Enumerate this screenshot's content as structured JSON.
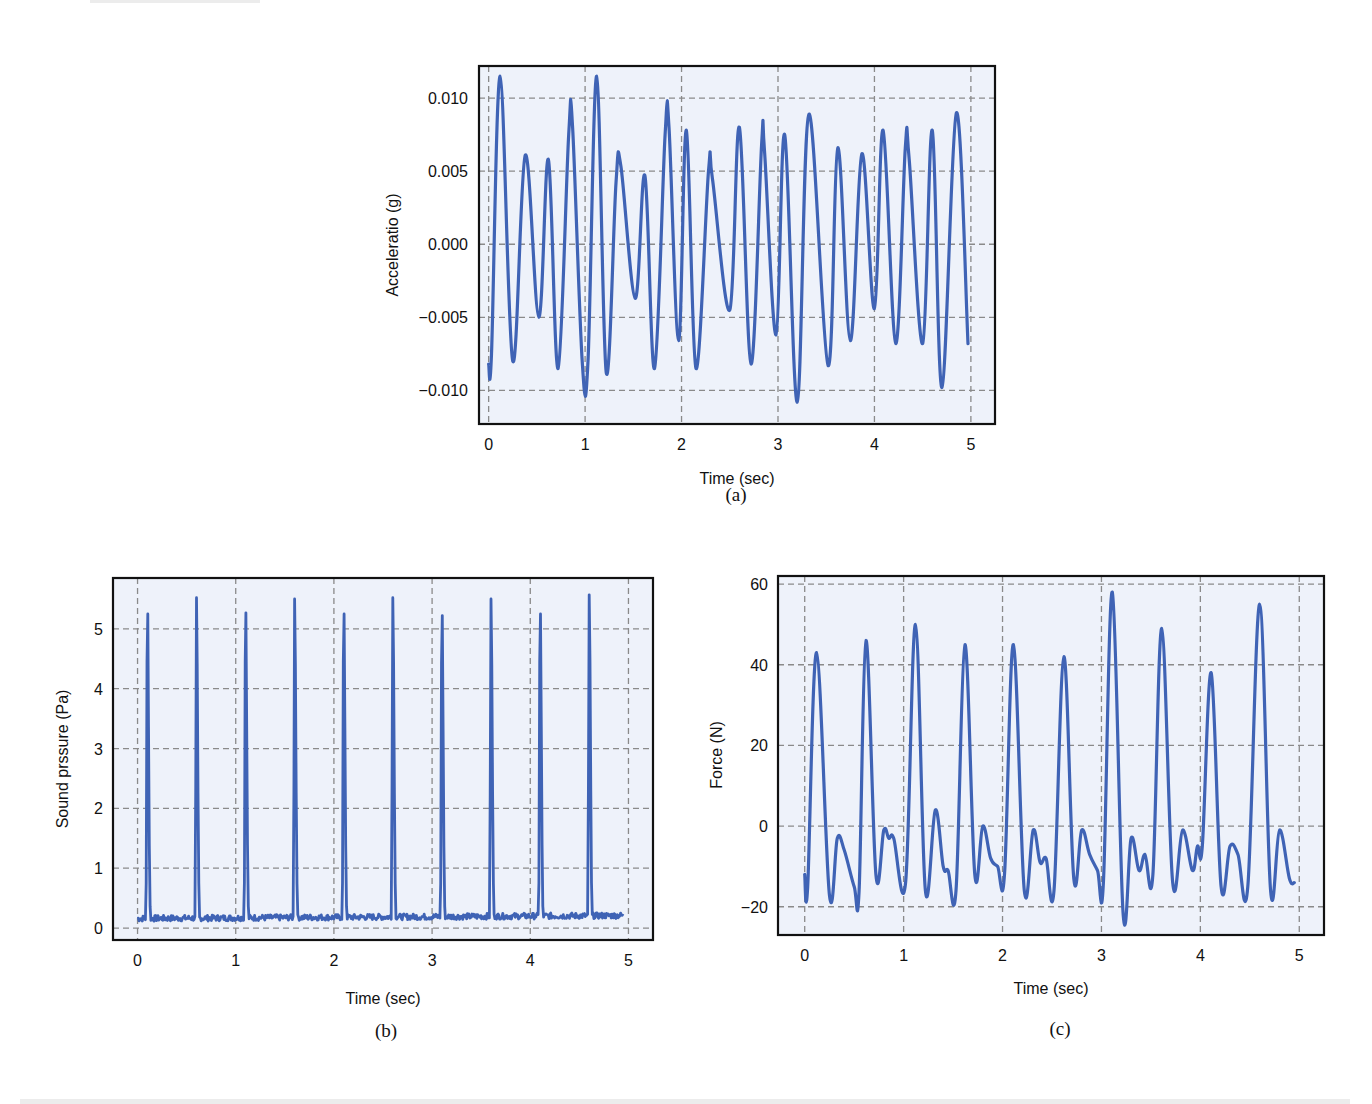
{
  "colors": {
    "plot_bg": "#eef2fa",
    "line": "#3f63b5",
    "grid": "#8a8a8a",
    "frame": "#111111"
  },
  "chart_data": [
    {
      "id": "a",
      "type": "line",
      "caption": "(a)",
      "title": "",
      "xlabel": "Time (sec)",
      "ylabel": "Acceleratio (g)",
      "xlim": [
        -0.1,
        5.25
      ],
      "ylim": [
        -0.0123,
        0.0122
      ],
      "xticks": [
        0,
        1,
        2,
        3,
        4,
        5
      ],
      "xtick_labels": [
        "0",
        "1",
        "2",
        "3",
        "4",
        "5"
      ],
      "yticks": [
        -0.01,
        -0.005,
        0.0,
        0.005,
        0.01
      ],
      "ytick_labels": [
        "−0.010",
        "−0.005",
        "0.000",
        "0.005",
        "0.010"
      ],
      "grid": true,
      "legend": null,
      "series": [
        {
          "name": "Acceleration",
          "x": [
            0.0,
            0.03,
            0.12,
            0.25,
            0.38,
            0.52,
            0.62,
            0.72,
            0.83,
            0.87,
            0.97,
            1.03,
            1.12,
            1.22,
            1.32,
            1.37,
            1.52,
            1.62,
            1.72,
            1.83,
            1.87,
            1.97,
            2.05,
            2.15,
            2.28,
            2.32,
            2.5,
            2.6,
            2.72,
            2.83,
            2.86,
            2.98,
            3.07,
            3.2,
            3.32,
            3.52,
            3.62,
            3.75,
            3.87,
            4.0,
            4.09,
            4.22,
            4.32,
            4.36,
            4.5,
            4.6,
            4.7,
            4.85,
            4.97
          ],
          "y": [
            -0.0082,
            -0.0075,
            0.0115,
            -0.008,
            0.0061,
            -0.005,
            0.0058,
            -0.0085,
            0.0075,
            0.008,
            -0.008,
            -0.008,
            0.0115,
            -0.0088,
            0.0042,
            0.0054,
            -0.0037,
            0.0047,
            -0.0085,
            0.0075,
            0.008,
            -0.0066,
            0.0078,
            -0.0085,
            0.005,
            0.0045,
            -0.0045,
            0.008,
            -0.0082,
            0.0068,
            0.0064,
            -0.0062,
            0.0075,
            -0.0108,
            0.0089,
            -0.0083,
            0.0066,
            -0.0066,
            0.0062,
            -0.0044,
            0.0078,
            -0.0068,
            0.0066,
            0.0058,
            -0.0068,
            0.0078,
            -0.0098,
            0.009,
            -0.0068
          ]
        }
      ]
    },
    {
      "id": "b",
      "type": "line",
      "caption": "(b)",
      "title": "",
      "xlabel": "Time (sec)",
      "ylabel": "Sound prssure (Pa)",
      "xlim": [
        -0.25,
        5.25
      ],
      "ylim": [
        -0.2,
        5.85
      ],
      "xticks": [
        0,
        1,
        2,
        3,
        4,
        5
      ],
      "xtick_labels": [
        "0",
        "1",
        "2",
        "3",
        "4",
        "5"
      ],
      "yticks": [
        0,
        1,
        2,
        3,
        4,
        5
      ],
      "ytick_labels": [
        "0",
        "1",
        "2",
        "3",
        "4",
        "5"
      ],
      "grid": true,
      "legend": null,
      "series": [
        {
          "name": "Sound pressure",
          "peak_times": [
            0.1,
            0.6,
            1.1,
            1.6,
            2.1,
            2.6,
            3.1,
            3.6,
            4.1,
            4.6
          ],
          "peak_values": [
            5.55,
            5.52,
            5.57,
            5.5,
            5.55,
            5.52,
            5.52,
            5.5,
            5.55,
            5.57
          ],
          "baseline_range": [
            0.05,
            0.25
          ],
          "x_range": [
            0.0,
            4.95
          ]
        }
      ]
    },
    {
      "id": "c",
      "type": "line",
      "caption": "(c)",
      "title": "",
      "xlabel": "Time (sec)",
      "ylabel": "Force (N)",
      "xlim": [
        -0.27,
        5.25
      ],
      "ylim": [
        -27,
        62
      ],
      "xticks": [
        0,
        1,
        2,
        3,
        4,
        5
      ],
      "xtick_labels": [
        "0",
        "1",
        "2",
        "3",
        "4",
        "5"
      ],
      "yticks": [
        -20,
        0,
        20,
        40,
        60
      ],
      "ytick_labels": [
        "−20",
        "0",
        "20",
        "40",
        "60"
      ],
      "grid": true,
      "legend": null,
      "series": [
        {
          "name": "Force",
          "x": [
            0.0,
            0.03,
            0.12,
            0.25,
            0.33,
            0.4,
            0.5,
            0.55,
            0.62,
            0.72,
            0.8,
            0.85,
            0.9,
            1.02,
            1.12,
            1.22,
            1.32,
            1.4,
            1.45,
            1.53,
            1.62,
            1.72,
            1.8,
            1.88,
            1.95,
            2.02,
            2.11,
            2.22,
            2.31,
            2.38,
            2.44,
            2.52,
            2.62,
            2.72,
            2.8,
            2.88,
            2.96,
            3.02,
            3.11,
            3.22,
            3.3,
            3.38,
            3.44,
            3.52,
            3.61,
            3.72,
            3.82,
            3.92,
            3.97,
            4.02,
            4.11,
            4.21,
            4.3,
            4.38,
            4.48,
            4.6,
            4.71,
            4.8,
            4.9,
            4.95
          ],
          "y": [
            -12,
            -15,
            43,
            -17,
            -3,
            -6,
            -15,
            -16,
            46,
            -12,
            -1,
            -3,
            -3,
            -14,
            50,
            -16,
            4,
            -10,
            -11,
            -16,
            45,
            -12,
            0,
            -8,
            -10,
            -12,
            45,
            -16,
            -1,
            -9,
            -8,
            -16,
            42,
            -13,
            -1,
            -7,
            -11,
            -14,
            58,
            -22,
            -3,
            -11,
            -7,
            -12,
            49,
            -14,
            -1,
            -11,
            -5,
            -5,
            38,
            -15,
            -5,
            -7,
            -15,
            55,
            -16,
            -1,
            -13,
            -14
          ]
        }
      ]
    }
  ],
  "figures": {
    "a": {
      "ylabel": "Acceleratio (g)",
      "xlabel": "Time (sec)",
      "caption": "(a)"
    },
    "b": {
      "ylabel": "Sound prssure (Pa)",
      "xlabel": "Time (sec)",
      "caption": "(b)"
    },
    "c": {
      "ylabel": "Force (N)",
      "xlabel": "Time (sec)",
      "caption": "(c)"
    }
  }
}
